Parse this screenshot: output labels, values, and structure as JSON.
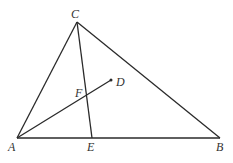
{
  "diagram": {
    "type": "geometry-triangle",
    "points": {
      "A": {
        "label": "A",
        "x": 17,
        "y": 138
      },
      "B": {
        "label": "B",
        "x": 220,
        "y": 138
      },
      "C": {
        "label": "C",
        "x": 77,
        "y": 22
      },
      "D": {
        "label": "D",
        "x": 111,
        "y": 80
      },
      "E": {
        "label": "E",
        "x": 92,
        "y": 138
      },
      "F": {
        "label": "F",
        "x": 86,
        "y": 96
      }
    },
    "segments": [
      [
        "A",
        "B"
      ],
      [
        "B",
        "C"
      ],
      [
        "C",
        "A"
      ],
      [
        "C",
        "E"
      ],
      [
        "A",
        "D"
      ]
    ],
    "labels": {
      "A": "A",
      "B": "B",
      "C": "C",
      "D": "D",
      "E": "E",
      "F": "F"
    },
    "stroke_color": "#2a2a2a"
  }
}
